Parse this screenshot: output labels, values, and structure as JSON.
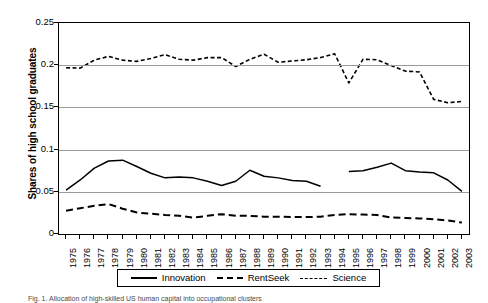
{
  "chart_data": {
    "type": "line",
    "title": "",
    "xlabel": "",
    "ylabel": "Shares of high school graduates",
    "ylim": [
      0,
      0.25
    ],
    "ytick_labels": [
      "0.25",
      "0.2",
      "0.15",
      "0.1",
      "0.05",
      "0"
    ],
    "ytick_values": [
      0.25,
      0.2,
      0.15,
      0.1,
      0.05,
      0
    ],
    "grid": true,
    "grid_axis": "y",
    "legend_position": "bottom-outside",
    "categories": [
      "1975",
      "1976",
      "1977",
      "1978",
      "1979",
      "1980",
      "1981",
      "1982",
      "1983",
      "1984",
      "1985",
      "1986",
      "1987",
      "1988",
      "1989",
      "1990",
      "1991",
      "1992",
      "1993",
      "1994",
      "1995",
      "1996",
      "1997",
      "1998",
      "1999",
      "2000",
      "2001",
      "2002",
      "2003"
    ],
    "series": [
      {
        "name": "Innovation",
        "style": "solid",
        "color": "#000000",
        "values": [
          0.052,
          0.064,
          0.078,
          0.0865,
          0.0875,
          0.08,
          0.072,
          0.0665,
          0.0675,
          0.0665,
          0.0625,
          0.0575,
          0.0625,
          0.0755,
          0.0685,
          0.0665,
          0.0635,
          0.0625,
          0.0565,
          null,
          0.074,
          0.075,
          0.079,
          0.084,
          0.075,
          0.0735,
          0.0725,
          0.064,
          0.0505
        ]
      },
      {
        "name": "RentSeek",
        "style": "dashed",
        "color": "#000000",
        "values": [
          0.0275,
          0.0305,
          0.0335,
          0.0355,
          0.03,
          0.0255,
          0.024,
          0.0225,
          0.0215,
          0.0195,
          0.0215,
          0.0235,
          0.0215,
          0.0215,
          0.0205,
          0.0205,
          0.02,
          0.02,
          0.0205,
          0.0225,
          0.0235,
          0.023,
          0.0225,
          0.0195,
          0.019,
          0.0185,
          0.0175,
          0.016,
          0.0135
        ]
      },
      {
        "name": "Science",
        "style": "dotted",
        "color": "#000000",
        "values": [
          0.197,
          0.1965,
          0.206,
          0.2105,
          0.206,
          0.2045,
          0.208,
          0.2125,
          0.207,
          0.206,
          0.209,
          0.209,
          0.1985,
          0.207,
          0.213,
          0.2035,
          0.205,
          0.2065,
          0.209,
          0.2135,
          0.179,
          0.207,
          0.2065,
          0.1995,
          0.193,
          0.192,
          0.1595,
          0.1555,
          0.157
        ]
      }
    ]
  },
  "legend": {
    "entries": [
      {
        "label": "Innovation",
        "style": "solid"
      },
      {
        "label": "RentSeek",
        "style": "dashed"
      },
      {
        "label": "Science",
        "style": "dotted"
      }
    ]
  },
  "caption": "Fig. 1.  Allocation of high-skilled US human capital into occupational clusters"
}
